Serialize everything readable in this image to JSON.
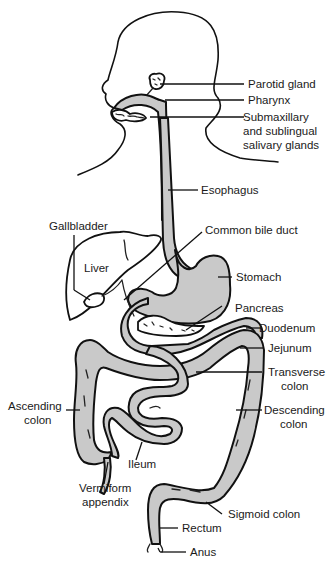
{
  "figure": {
    "colors": {
      "organ_fill": "#c9c9c9",
      "line": "#111111",
      "background": "#ffffff"
    }
  },
  "labels": {
    "parotid_gland": "Parotid gland",
    "pharynx": "Pharynx",
    "salivary_1": "Submaxillary",
    "salivary_2": "and sublingual",
    "salivary_3": "salivary glands",
    "esophagus": "Esophagus",
    "gallbladder": "Gallbladder",
    "common_bile_duct": "Common bile duct",
    "liver": "Liver",
    "stomach": "Stomach",
    "pancreas": "Pancreas",
    "duodenum": "Duodenum",
    "jejunum": "Jejunum",
    "transverse_1": "Transverse",
    "transverse_2": "colon",
    "ascending_1": "Ascending",
    "ascending_2": "colon",
    "descending_1": "Descending",
    "descending_2": "colon",
    "ileum": "Ileum",
    "appendix_1": "Vermiform",
    "appendix_2": "appendix",
    "sigmoid_colon": "Sigmoid colon",
    "rectum": "Rectum",
    "anus": "Anus"
  }
}
